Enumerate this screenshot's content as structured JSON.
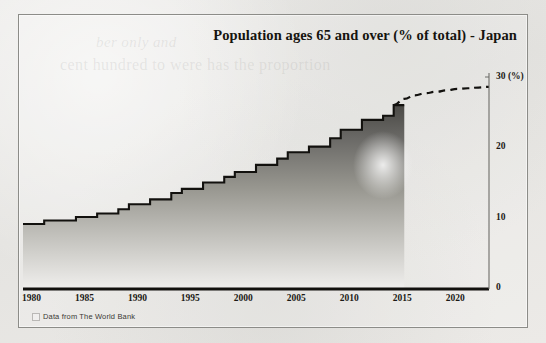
{
  "figure": {
    "title": "Population ages 65 and over (% of total) - Japan",
    "source_note": "Data from The World Bank",
    "ghost_text_top": "ber  only and",
    "ghost_text_mid": "cent  hundred  to  were  has  the           proportion",
    "ghost_text_edge": ""
  },
  "axes": {
    "y_unit_label": "(%)",
    "y_ticks": [
      "0",
      "10",
      "20",
      "30"
    ],
    "x_ticks": [
      "1980",
      "1985",
      "1990",
      "1995",
      "2000",
      "2005",
      "2010",
      "2015",
      "2020"
    ]
  },
  "colors": {
    "line": "#12110e",
    "fill_top": "#4a4945",
    "fill_bottom": "#efeeec",
    "frame": "#8c8c88",
    "paper": "#e9e9e7",
    "text": "#15140f"
  },
  "chart_data": {
    "type": "area",
    "title": "Population ages 65 and over (% of total) - Japan",
    "xlabel": "",
    "ylabel": "(%)",
    "xlim": [
      1980,
      2024
    ],
    "ylim": [
      0,
      30
    ],
    "grid": false,
    "legend": false,
    "step": true,
    "series": [
      {
        "name": "Population ages 65 and over (% of total)",
        "style": "solid",
        "x": [
          1980,
          1981,
          1982,
          1983,
          1984,
          1985,
          1986,
          1987,
          1988,
          1989,
          1990,
          1991,
          1992,
          1993,
          1994,
          1995,
          1996,
          1997,
          1998,
          1999,
          2000,
          2001,
          2002,
          2003,
          2004,
          2005,
          2006,
          2007,
          2008,
          2009,
          2010,
          2011,
          2012,
          2013,
          2014,
          2015
        ],
        "values": [
          9.1,
          9.1,
          9.6,
          9.6,
          9.6,
          10.1,
          10.1,
          10.6,
          10.6,
          11.2,
          11.9,
          11.9,
          12.6,
          12.6,
          13.5,
          14.1,
          14.1,
          15.0,
          15.0,
          15.8,
          16.5,
          16.5,
          17.5,
          17.5,
          18.4,
          19.3,
          19.3,
          20.1,
          20.1,
          21.3,
          22.5,
          22.5,
          23.9,
          23.9,
          24.5,
          26.0
        ]
      },
      {
        "name": "Projection",
        "style": "dashed",
        "x": [
          2015,
          2016,
          2017,
          2018,
          2019,
          2020,
          2021,
          2022,
          2023,
          2024
        ],
        "values": [
          26.0,
          26.9,
          27.4,
          27.7,
          27.9,
          28.1,
          28.3,
          28.4,
          28.5,
          28.6
        ]
      }
    ]
  }
}
